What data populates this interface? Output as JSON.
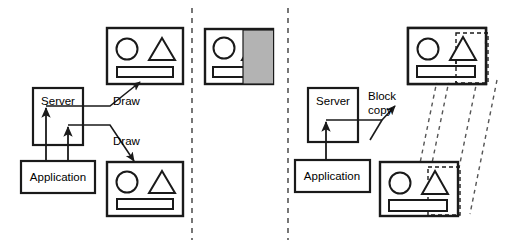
{
  "figure": {
    "width": 508,
    "height": 248,
    "background": "#ffffff",
    "stroke": "#1a1a1a",
    "shade_fill": "#b3b3b3",
    "panels": [
      {
        "id": "left",
        "name": "draw-panel"
      },
      {
        "id": "middle",
        "name": "occluded-window-panel"
      },
      {
        "id": "right",
        "name": "block-copy-panel"
      }
    ],
    "dividers": [
      {
        "name": "panel-divider-1",
        "x": 192,
        "y1": 8,
        "y2": 240
      },
      {
        "name": "panel-divider-2",
        "x": 288,
        "y1": 8,
        "y2": 240
      }
    ]
  },
  "left_panel": {
    "server_label": "Server",
    "application_label": "Application",
    "arrow_label_top": "Draw",
    "arrow_label_bottom": "Draw",
    "window_top": {
      "name": "window-top-left",
      "shapes": [
        "circle",
        "triangle",
        "rectangle-bar"
      ]
    },
    "window_bottom": {
      "name": "window-bottom-left",
      "shapes": [
        "circle",
        "triangle",
        "rectangle-bar"
      ]
    }
  },
  "middle_panel": {
    "window": {
      "name": "window-occluded",
      "shapes": [
        "circle",
        "clipped-triangle",
        "clipped-rectangle-bar"
      ],
      "occluder": {
        "name": "gray-occluding-region",
        "fill": "#b3b3b3"
      }
    }
  },
  "right_panel": {
    "server_label": "Server",
    "application_label": "Application",
    "operation_label_line1": "Block",
    "operation_label_line2": "copy",
    "window_top": {
      "name": "window-top-right",
      "shapes": [
        "circle",
        "triangle",
        "rectangle-bar"
      ],
      "selection": "dashed-block-region"
    },
    "window_bottom": {
      "name": "window-bottom-right",
      "shapes": [
        "circle",
        "triangle",
        "rectangle-bar"
      ],
      "selection": "dashed-block-region"
    },
    "copy_trace_lines": 4
  }
}
